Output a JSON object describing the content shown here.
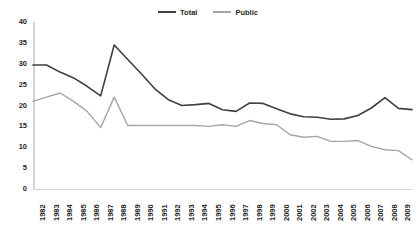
{
  "chart_data": {
    "type": "line",
    "title": "",
    "xlabel": "",
    "ylabel": "",
    "ylim": [
      0,
      40
    ],
    "ytick_step": 5,
    "yticks": [
      0,
      5,
      10,
      15,
      20,
      25,
      30,
      35,
      40
    ],
    "grid": false,
    "legend_position": "top-center",
    "categories": [
      "1982",
      "1983",
      "1984",
      "1985",
      "1986",
      "1987",
      "1988",
      "1989",
      "1990",
      "1991",
      "1992",
      "1993",
      "1994",
      "1995",
      "1996",
      "1997",
      "1998",
      "1999",
      "2000",
      "2001",
      "2002",
      "2003",
      "2004",
      "2005",
      "2006",
      "2007",
      "2008",
      "2009",
      "2010"
    ],
    "series": [
      {
        "name": "Total",
        "color": "#404040",
        "values": [
          29.7,
          29.7,
          28.0,
          26.6,
          24.6,
          22.3,
          34.5,
          31.0,
          27.6,
          24.0,
          21.4,
          20.0,
          20.2,
          20.5,
          19.0,
          18.6,
          20.6,
          20.5,
          19.2,
          18.0,
          17.3,
          17.2,
          16.7,
          16.8,
          17.6,
          19.4,
          21.9,
          19.3,
          19.0
        ]
      },
      {
        "name": "Public",
        "color": "#a6a6a6",
        "values": [
          21.0,
          22.0,
          23.0,
          21.0,
          18.6,
          14.7,
          22.0,
          15.2,
          15.2,
          15.2,
          15.2,
          15.2,
          15.2,
          15.0,
          15.4,
          15.0,
          16.4,
          15.7,
          15.4,
          13.0,
          12.4,
          12.6,
          11.4,
          11.4,
          11.6,
          10.2,
          9.4,
          9.2,
          7.0
        ]
      }
    ]
  },
  "legend": {
    "items": [
      {
        "label": "Total"
      },
      {
        "label": "Public"
      }
    ]
  }
}
